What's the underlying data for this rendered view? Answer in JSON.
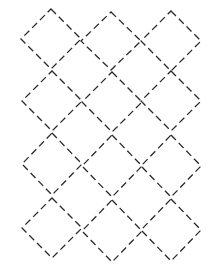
{
  "diagram": {
    "title": "",
    "background": "#ffffff",
    "stroke_color": "#2a2a2a",
    "dash_pattern": "7,4",
    "diamonds": [
      {
        "cx": 51,
        "cy": 39,
        "rx": 30,
        "ry": 30
      },
      {
        "cx": 111,
        "cy": 41,
        "rx": 30,
        "ry": 29
      },
      {
        "cx": 171,
        "cy": 41,
        "rx": 30,
        "ry": 30
      },
      {
        "cx": 52,
        "cy": 101,
        "rx": 30,
        "ry": 30
      },
      {
        "cx": 112,
        "cy": 102,
        "rx": 30,
        "ry": 30
      },
      {
        "cx": 171,
        "cy": 101,
        "rx": 30,
        "ry": 30
      },
      {
        "cx": 52,
        "cy": 164,
        "rx": 30,
        "ry": 31
      },
      {
        "cx": 112,
        "cy": 166,
        "rx": 30,
        "ry": 31
      },
      {
        "cx": 171,
        "cy": 166,
        "rx": 30,
        "ry": 31
      },
      {
        "cx": 52,
        "cy": 228,
        "rx": 30,
        "ry": 30
      },
      {
        "cx": 112,
        "cy": 231,
        "rx": 30,
        "ry": 31
      },
      {
        "cx": 171,
        "cy": 230,
        "rx": 30,
        "ry": 31
      }
    ]
  }
}
